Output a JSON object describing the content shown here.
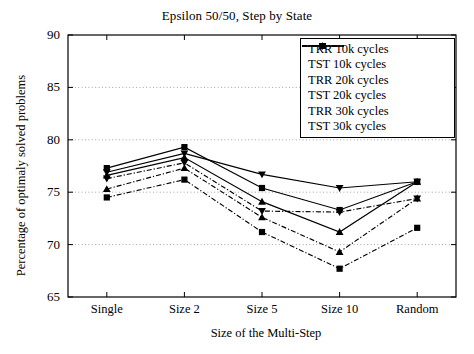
{
  "chart_data": {
    "type": "line",
    "title": "Epsilon 50/50, Step by State",
    "xlabel": "Size of the Multi-Step",
    "ylabel": "Percentage of optimaly solved problems",
    "categories": [
      "Single",
      "Size 2",
      "Size 5",
      "Size 10",
      "Random"
    ],
    "ylim": [
      65,
      90
    ],
    "yticks": [
      65,
      70,
      75,
      80,
      85,
      90
    ],
    "grid": "horizontal-dotted",
    "legend_position": "top-right-inside",
    "series": [
      {
        "name": "TRR 10k cycles",
        "marker": "square",
        "line": "solid",
        "color": "#000000",
        "values": [
          77.3,
          79.3,
          75.4,
          73.3,
          76.0
        ]
      },
      {
        "name": "TST 10k cycles",
        "marker": "square",
        "line": "dash-dot",
        "color": "#000000",
        "values": [
          74.5,
          76.2,
          71.2,
          67.7,
          71.6
        ]
      },
      {
        "name": "TRR 20k cycles",
        "marker": "triangle-up",
        "line": "solid",
        "color": "#000000",
        "values": [
          76.6,
          78.3,
          74.1,
          71.2,
          76.0
        ]
      },
      {
        "name": "TST 20k cycles",
        "marker": "triangle-up",
        "line": "dash-dot",
        "color": "#000000",
        "values": [
          75.3,
          77.3,
          72.6,
          69.3,
          74.4
        ]
      },
      {
        "name": "TRR 30k cycles",
        "marker": "triangle-down",
        "line": "solid",
        "color": "#000000",
        "values": [
          76.9,
          78.7,
          76.7,
          75.4,
          76.0
        ]
      },
      {
        "name": "TST 30k cycles",
        "marker": "triangle-down",
        "line": "dash-dot",
        "color": "#000000",
        "values": [
          76.3,
          77.8,
          73.2,
          73.1,
          74.4
        ]
      }
    ]
  },
  "legend": {
    "items": [
      "TRR 10k cycles",
      "TST 10k cycles",
      "TRR 20k cycles",
      "TST 20k cycles",
      "TRR 30k cycles",
      "TST 30k cycles"
    ]
  }
}
